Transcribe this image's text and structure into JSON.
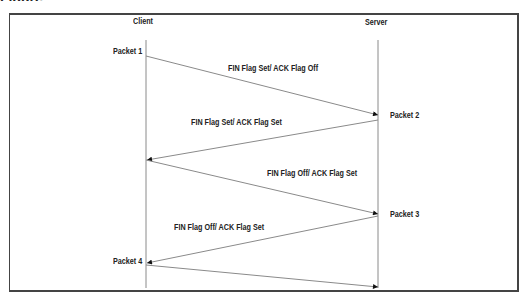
{
  "figure_caption": "Figure",
  "entities": {
    "client": "Client",
    "server": "Server"
  },
  "packets": [
    {
      "label": "Packet 1",
      "from": "client",
      "to": "server",
      "flags": "FIN Flag Set/ ACK Flag Off"
    },
    {
      "label": "Packet 2",
      "from": "server",
      "to": "client",
      "flags": "FIN Flag Set/ ACK Flag Set"
    },
    {
      "label": "Packet 3",
      "from": "client",
      "to": "server",
      "flags": "FIN Flag Off/ ACK Flag Set"
    },
    {
      "label": "Packet 4",
      "from": "server",
      "to": "client",
      "flags": "FIN Flag Off/ ACK Flag Set"
    }
  ],
  "colors": {
    "line": "#8a8a8a",
    "arrow": "#111111",
    "text": "#222222",
    "border": "#444444"
  }
}
